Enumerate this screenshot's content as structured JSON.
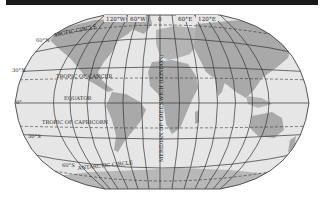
{
  "map": {
    "projection": "world-elliptical",
    "colors": {
      "ocean": "#e6e6e6",
      "land": "#a9a9a9",
      "land_light": "#c4c4c4",
      "grid": "#333333",
      "outline": "#444444",
      "top_bar": "#1a1a1a",
      "background": "#ffffff"
    },
    "longitude_labels": [
      "120°W",
      "60°W",
      "0",
      "60°E",
      "120°E"
    ],
    "latitude_labels": [
      "60°N",
      "30°N",
      "0°",
      "30°S",
      "60°S"
    ],
    "special_parallels": {
      "arctic": "ARCTIC CIRCLE",
      "cancer": "TROPIC OF CANCER",
      "equator": "EQUATOR",
      "capricorn": "TROPIC OF CAPRICORN",
      "antarctic": "ANTARCTIC CIRCLE"
    },
    "prime_meridian_label": "MERIDIAN OF GREENWICH (LONDON)"
  }
}
